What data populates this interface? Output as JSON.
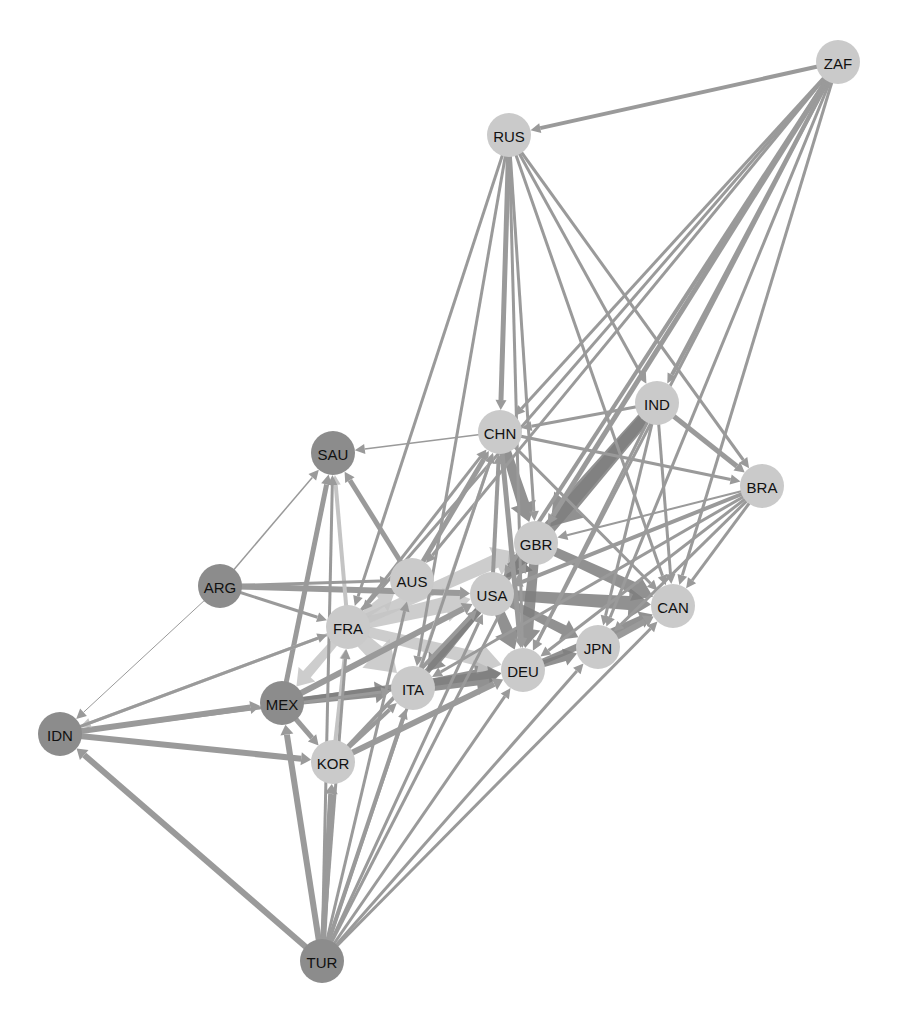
{
  "diagram": {
    "type": "directed-network",
    "colors": {
      "background": "#ffffff",
      "node_dark": "#8c8c8c",
      "node_light": "#cacaca",
      "edge_default": "#9a9a9a",
      "edge_dark": "#7e7e7e",
      "edge_light": "#c4c4c4",
      "label": "#111111"
    },
    "node_radius": 22,
    "nodes": [
      {
        "id": "ZAF",
        "label": "ZAF",
        "x": 838,
        "y": 62,
        "shade": "light"
      },
      {
        "id": "RUS",
        "label": "RUS",
        "x": 509,
        "y": 135,
        "shade": "light"
      },
      {
        "id": "IND",
        "label": "IND",
        "x": 657,
        "y": 403,
        "shade": "light"
      },
      {
        "id": "CHN",
        "label": "CHN",
        "x": 500,
        "y": 432,
        "shade": "light"
      },
      {
        "id": "SAU",
        "label": "SAU",
        "x": 333,
        "y": 453,
        "shade": "dark"
      },
      {
        "id": "BRA",
        "label": "BRA",
        "x": 762,
        "y": 486,
        "shade": "light"
      },
      {
        "id": "GBR",
        "label": "GBR",
        "x": 536,
        "y": 543,
        "shade": "light"
      },
      {
        "id": "ARG",
        "label": "ARG",
        "x": 220,
        "y": 586,
        "shade": "dark"
      },
      {
        "id": "AUS",
        "label": "AUS",
        "x": 412,
        "y": 580,
        "shade": "light"
      },
      {
        "id": "USA",
        "label": "USA",
        "x": 492,
        "y": 594,
        "shade": "light"
      },
      {
        "id": "CAN",
        "label": "CAN",
        "x": 673,
        "y": 606,
        "shade": "light"
      },
      {
        "id": "FRA",
        "label": "FRA",
        "x": 348,
        "y": 627,
        "shade": "light"
      },
      {
        "id": "JPN",
        "label": "JPN",
        "x": 598,
        "y": 647,
        "shade": "light"
      },
      {
        "id": "DEU",
        "label": "DEU",
        "x": 523,
        "y": 670,
        "shade": "light"
      },
      {
        "id": "ITA",
        "label": "ITA",
        "x": 413,
        "y": 688,
        "shade": "light"
      },
      {
        "id": "MEX",
        "label": "MEX",
        "x": 282,
        "y": 703,
        "shade": "dark"
      },
      {
        "id": "IDN",
        "label": "IDN",
        "x": 60,
        "y": 734,
        "shade": "dark"
      },
      {
        "id": "KOR",
        "label": "KOR",
        "x": 333,
        "y": 762,
        "shade": "light"
      },
      {
        "id": "TUR",
        "label": "TUR",
        "x": 322,
        "y": 961,
        "shade": "dark"
      }
    ],
    "edges": [
      {
        "from": "ZAF",
        "to": "RUS",
        "w": 4
      },
      {
        "from": "ZAF",
        "to": "CHN",
        "w": 3
      },
      {
        "from": "ZAF",
        "to": "IND",
        "w": 4
      },
      {
        "from": "ZAF",
        "to": "GBR",
        "w": 5
      },
      {
        "from": "ZAF",
        "to": "USA",
        "w": 4
      },
      {
        "from": "ZAF",
        "to": "AUS",
        "w": 3
      },
      {
        "from": "ZAF",
        "to": "DEU",
        "w": 3
      },
      {
        "from": "ZAF",
        "to": "CAN",
        "w": 3
      },
      {
        "from": "ZAF",
        "to": "JPN",
        "w": 3
      },
      {
        "from": "ZAF",
        "to": "FRA",
        "w": 3
      },
      {
        "from": "RUS",
        "to": "CHN",
        "w": 5
      },
      {
        "from": "RUS",
        "to": "IND",
        "w": 3
      },
      {
        "from": "RUS",
        "to": "BRA",
        "w": 3
      },
      {
        "from": "RUS",
        "to": "ITA",
        "w": 3
      },
      {
        "from": "RUS",
        "to": "DEU",
        "w": 3
      },
      {
        "from": "RUS",
        "to": "FRA",
        "w": 3
      },
      {
        "from": "RUS",
        "to": "CAN",
        "w": 3
      },
      {
        "from": "RUS",
        "to": "GBR",
        "w": 3
      },
      {
        "from": "IND",
        "to": "CHN",
        "w": 3
      },
      {
        "from": "IND",
        "to": "BRA",
        "w": 5
      },
      {
        "from": "IND",
        "to": "GBR",
        "w": 18,
        "shade": "dark"
      },
      {
        "from": "IND",
        "to": "USA",
        "w": 14,
        "shade": "dark"
      },
      {
        "from": "IND",
        "to": "CAN",
        "w": 3
      },
      {
        "from": "IND",
        "to": "DEU",
        "w": 3
      },
      {
        "from": "IND",
        "to": "JPN",
        "w": 3
      },
      {
        "from": "CHN",
        "to": "SAU",
        "w": 1.5
      },
      {
        "from": "CHN",
        "to": "BRA",
        "w": 3
      },
      {
        "from": "CHN",
        "to": "GBR",
        "w": 12,
        "shade": "dark"
      },
      {
        "from": "CHN",
        "to": "DEU",
        "w": 5
      },
      {
        "from": "CHN",
        "to": "CAN",
        "w": 3
      },
      {
        "from": "AUS",
        "to": "CHN",
        "w": 5
      },
      {
        "from": "USA",
        "to": "CHN",
        "w": 4
      },
      {
        "from": "ITA",
        "to": "CHN",
        "w": 3,
        "shade": "light"
      },
      {
        "from": "FRA",
        "to": "CHN",
        "w": 3
      },
      {
        "from": "AUS",
        "to": "SAU",
        "w": 5
      },
      {
        "from": "ARG",
        "to": "SAU",
        "w": 1.5
      },
      {
        "from": "MEX",
        "to": "SAU",
        "w": 5
      },
      {
        "from": "FRA",
        "to": "SAU",
        "w": 4,
        "shade": "light"
      },
      {
        "from": "TUR",
        "to": "SAU",
        "w": 3
      },
      {
        "from": "BRA",
        "to": "GBR",
        "w": 2
      },
      {
        "from": "BRA",
        "to": "CAN",
        "w": 3
      },
      {
        "from": "BRA",
        "to": "USA",
        "w": 4
      },
      {
        "from": "BRA",
        "to": "JPN",
        "w": 3
      },
      {
        "from": "BRA",
        "to": "DEU",
        "w": 3
      },
      {
        "from": "BRA",
        "to": "ITA",
        "w": 3
      },
      {
        "from": "ARG",
        "to": "AUS",
        "w": 3
      },
      {
        "from": "ARG",
        "to": "USA",
        "w": 6
      },
      {
        "from": "ARG",
        "to": "FRA",
        "w": 3
      },
      {
        "from": "ARG",
        "to": "IDN",
        "w": 1
      },
      {
        "from": "GBR",
        "to": "USA",
        "w": 14,
        "shade": "dark"
      },
      {
        "from": "GBR",
        "to": "CAN",
        "w": 12,
        "shade": "dark"
      },
      {
        "from": "GBR",
        "to": "DEU",
        "w": 12,
        "shade": "dark"
      },
      {
        "from": "USA",
        "to": "CAN",
        "w": 14,
        "shade": "dark"
      },
      {
        "from": "USA",
        "to": "JPN",
        "w": 10,
        "shade": "dark"
      },
      {
        "from": "USA",
        "to": "DEU",
        "w": 12,
        "shade": "dark"
      },
      {
        "from": "USA",
        "to": "ITA",
        "w": 10,
        "shade": "dark"
      },
      {
        "from": "FRA",
        "to": "USA",
        "w": 16,
        "shade": "light"
      },
      {
        "from": "FRA",
        "to": "GBR",
        "w": 14,
        "shade": "light"
      },
      {
        "from": "FRA",
        "to": "DEU",
        "w": 14,
        "shade": "light"
      },
      {
        "from": "FRA",
        "to": "ITA",
        "w": 18,
        "shade": "light"
      },
      {
        "from": "FRA",
        "to": "AUS",
        "w": 10,
        "shade": "light"
      },
      {
        "from": "FRA",
        "to": "MEX",
        "w": 10,
        "shade": "light"
      },
      {
        "from": "FRA",
        "to": "IDN",
        "w": 3,
        "shade": "light"
      },
      {
        "from": "ITA",
        "to": "DEU",
        "w": 16,
        "shade": "dark"
      },
      {
        "from": "ITA",
        "to": "GBR",
        "w": 8,
        "shade": "dark"
      },
      {
        "from": "MEX",
        "to": "ITA",
        "w": 10,
        "shade": "dark"
      },
      {
        "from": "MEX",
        "to": "DEU",
        "w": 8,
        "shade": "dark"
      },
      {
        "from": "MEX",
        "to": "USA",
        "w": 6
      },
      {
        "from": "JPN",
        "to": "CAN",
        "w": 6
      },
      {
        "from": "DEU",
        "to": "CAN",
        "w": 8,
        "shade": "dark"
      },
      {
        "from": "DEU",
        "to": "JPN",
        "w": 8,
        "shade": "dark"
      },
      {
        "from": "KOR",
        "to": "DEU",
        "w": 6
      },
      {
        "from": "KOR",
        "to": "FRA",
        "w": 4,
        "shade": "light"
      },
      {
        "from": "KOR",
        "to": "ITA",
        "w": 4
      },
      {
        "from": "KOR",
        "to": "USA",
        "w": 4
      },
      {
        "from": "IDN",
        "to": "MEX",
        "w": 6
      },
      {
        "from": "IDN",
        "to": "KOR",
        "w": 6
      },
      {
        "from": "IDN",
        "to": "FRA",
        "w": 3
      },
      {
        "from": "IDN",
        "to": "ITA",
        "w": 3
      },
      {
        "from": "MEX",
        "to": "KOR",
        "w": 5
      },
      {
        "from": "TUR",
        "to": "IDN",
        "w": 6
      },
      {
        "from": "TUR",
        "to": "MEX",
        "w": 6
      },
      {
        "from": "TUR",
        "to": "KOR",
        "w": 6
      },
      {
        "from": "TUR",
        "to": "ITA",
        "w": 4
      },
      {
        "from": "TUR",
        "to": "DEU",
        "w": 3
      },
      {
        "from": "TUR",
        "to": "USA",
        "w": 3
      },
      {
        "from": "TUR",
        "to": "JPN",
        "w": 3
      },
      {
        "from": "TUR",
        "to": "CAN",
        "w": 3
      },
      {
        "from": "TUR",
        "to": "GBR",
        "w": 3
      },
      {
        "from": "TUR",
        "to": "AUS",
        "w": 3
      },
      {
        "from": "TUR",
        "to": "CHN",
        "w": 3
      },
      {
        "from": "TUR",
        "to": "FRA",
        "w": 3
      }
    ]
  }
}
